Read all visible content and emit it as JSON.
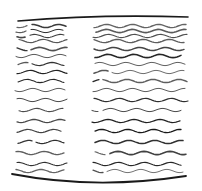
{
  "illustration": {
    "description": "Abstract hand-drawn wavy lines arranged in two columns between a curved top and bottom stroke",
    "stroke_color": "#1a1a1a",
    "background": "#ffffff",
    "top_curve": {
      "x1": 18,
      "y1": 21,
      "cx": 100,
      "cy": 14,
      "x2": 188,
      "y2": 17
    },
    "bottom_curve": {
      "x1": 12,
      "y1": 174,
      "cx": 95,
      "cy": 190,
      "x2": 186,
      "y2": 176
    },
    "left_column": {
      "x_start": 15,
      "x_end": 68
    },
    "right_column": {
      "x_start": 92,
      "x_end": 188
    },
    "rows_y": [
      22,
      26,
      31,
      36,
      41,
      49,
      56,
      64,
      72,
      81,
      90,
      100,
      110,
      121,
      131,
      142,
      153,
      164,
      171
    ],
    "wave_amplitude": 1.6,
    "wave_period": 26
  }
}
